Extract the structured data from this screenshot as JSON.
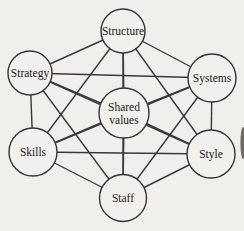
{
  "diagram": {
    "type": "network-diagram",
    "colors": {
      "background": "#f0efec",
      "line": "#3a3a38",
      "node_fill": "#f1f0ed",
      "node_stroke": "#353533",
      "text": "#1c1c1a",
      "artifact": "#56544c"
    },
    "nodes": [
      {
        "id": "structure",
        "label": "Structure",
        "label_lines": [
          "Structure"
        ],
        "x": 123,
        "y": 31,
        "r": 22
      },
      {
        "id": "strategy",
        "label": "Strategy",
        "label_lines": [
          "Strategy"
        ],
        "x": 30,
        "y": 73,
        "r": 22
      },
      {
        "id": "systems",
        "label": "Systems",
        "label_lines": [
          "Systems"
        ],
        "x": 212,
        "y": 78,
        "r": 24
      },
      {
        "id": "shared-values",
        "label": "Shared values",
        "label_lines": [
          "Shared",
          "values"
        ],
        "x": 124,
        "y": 113,
        "r": 25
      },
      {
        "id": "skills",
        "label": "Skills",
        "label_lines": [
          "Skills"
        ],
        "x": 33,
        "y": 152,
        "r": 24
      },
      {
        "id": "style",
        "label": "Style",
        "label_lines": [
          "Style"
        ],
        "x": 211,
        "y": 154,
        "r": 24
      },
      {
        "id": "staff",
        "label": "Staff",
        "label_lines": [
          "Staff"
        ],
        "x": 123,
        "y": 198,
        "r": 23.5
      }
    ],
    "edges": [
      [
        "structure",
        "strategy"
      ],
      [
        "structure",
        "systems"
      ],
      [
        "structure",
        "shared-values"
      ],
      [
        "structure",
        "skills"
      ],
      [
        "structure",
        "style"
      ],
      [
        "structure",
        "staff"
      ],
      [
        "strategy",
        "systems"
      ],
      [
        "strategy",
        "shared-values"
      ],
      [
        "strategy",
        "skills"
      ],
      [
        "strategy",
        "style"
      ],
      [
        "strategy",
        "staff"
      ],
      [
        "systems",
        "shared-values"
      ],
      [
        "systems",
        "skills"
      ],
      [
        "systems",
        "style"
      ],
      [
        "systems",
        "staff"
      ],
      [
        "shared-values",
        "skills"
      ],
      [
        "shared-values",
        "style"
      ],
      [
        "shared-values",
        "staff"
      ],
      [
        "skills",
        "style"
      ],
      [
        "skills",
        "staff"
      ],
      [
        "style",
        "staff"
      ]
    ],
    "artifact": {
      "x": 243,
      "y": 143,
      "rx": 2.6,
      "ry": 16
    }
  }
}
